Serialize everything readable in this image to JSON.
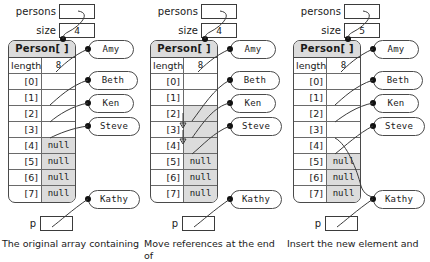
{
  "figure": {
    "panels": [
      {
        "id": "panel-1",
        "vars": {
          "persons_label": "persons",
          "persons_value": "",
          "size_label": "size",
          "size_value": "4"
        },
        "array": {
          "type_header": "Person[ ]",
          "length_key": "length",
          "length_value": "8",
          "rows": [
            {
              "key": "[0]",
              "value": "",
              "shaded": false
            },
            {
              "key": "[1]",
              "value": "",
              "shaded": false
            },
            {
              "key": "[2]",
              "value": "",
              "shaded": false
            },
            {
              "key": "[3]",
              "value": "",
              "shaded": false
            },
            {
              "key": "[4]",
              "value": "null",
              "shaded": true
            },
            {
              "key": "[5]",
              "value": "null",
              "shaded": true
            },
            {
              "key": "[6]",
              "value": "null",
              "shaded": true
            },
            {
              "key": "[7]",
              "value": "null",
              "shaded": true
            }
          ]
        },
        "pointer": {
          "label": "p",
          "value": ""
        },
        "bubbles": [
          {
            "name": "Amy"
          },
          {
            "name": "Beth"
          },
          {
            "name": "Ken"
          },
          {
            "name": "Steve"
          },
          {
            "name": "Kathy"
          }
        ],
        "caption": "The original array containing"
      },
      {
        "id": "panel-2",
        "vars": {
          "persons_label": "persons",
          "persons_value": "",
          "size_label": "size",
          "size_value": "4"
        },
        "array": {
          "type_header": "Person[ ]",
          "length_key": "length",
          "length_value": "8",
          "rows": [
            {
              "key": "[0]",
              "value": "",
              "shaded": false
            },
            {
              "key": "[1]",
              "value": "",
              "shaded": false
            },
            {
              "key": "[2]",
              "value": "",
              "shaded": true
            },
            {
              "key": "[3]",
              "value": "",
              "shaded": true
            },
            {
              "key": "[4]",
              "value": "",
              "shaded": true
            },
            {
              "key": "[5]",
              "value": "null",
              "shaded": true
            },
            {
              "key": "[6]",
              "value": "null",
              "shaded": true
            },
            {
              "key": "[7]",
              "value": "null",
              "shaded": true
            }
          ]
        },
        "pointer": {
          "label": "p",
          "value": ""
        },
        "bubbles": [
          {
            "name": "Amy"
          },
          {
            "name": "Beth"
          },
          {
            "name": "Ken"
          },
          {
            "name": "Steve"
          },
          {
            "name": "Kathy"
          }
        ],
        "caption": "Move references at the end of"
      },
      {
        "id": "panel-3",
        "vars": {
          "persons_label": "persons",
          "persons_value": "",
          "size_label": "size",
          "size_value": "5"
        },
        "array": {
          "type_header": "Person[ ]",
          "length_key": "length",
          "length_value": "8",
          "rows": [
            {
              "key": "[0]",
              "value": "",
              "shaded": false
            },
            {
              "key": "[1]",
              "value": "",
              "shaded": false
            },
            {
              "key": "[2]",
              "value": "",
              "shaded": false
            },
            {
              "key": "[3]",
              "value": "",
              "shaded": false
            },
            {
              "key": "[4]",
              "value": "",
              "shaded": false
            },
            {
              "key": "[5]",
              "value": "null",
              "shaded": true
            },
            {
              "key": "[6]",
              "value": "null",
              "shaded": true
            },
            {
              "key": "[7]",
              "value": "null",
              "shaded": true
            }
          ]
        },
        "pointer": {
          "label": "p",
          "value": ""
        },
        "bubbles": [
          {
            "name": "Amy"
          },
          {
            "name": "Beth"
          },
          {
            "name": "Ken"
          },
          {
            "name": "Steve"
          },
          {
            "name": "Kathy"
          }
        ],
        "caption": "Insert the new element and"
      }
    ]
  },
  "colors": {
    "shade": "#dcdcdc",
    "stroke": "#3b3b3b",
    "text": "#1a1a1a"
  }
}
